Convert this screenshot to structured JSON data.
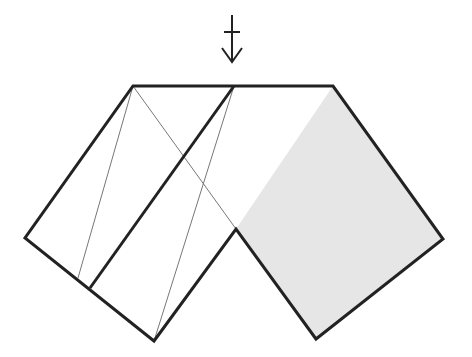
{
  "diagram": {
    "type": "origami-fold-step",
    "width": 472,
    "height": 357,
    "colors": {
      "stroke": "#222222",
      "thin_stroke": "#777777",
      "fill_shaded": "#e6e6e6",
      "background": "#ffffff"
    },
    "arrow": {
      "name": "push-down-arrow",
      "x": 232,
      "y_top": 15,
      "y_bottom": 62,
      "crossbar_y": 32,
      "crossbar_half": 8,
      "head_half": 10,
      "head_len": 14
    },
    "shaded_panel": {
      "points": "333,86 443,239 316,339 236,229"
    },
    "outline": {
      "points": "133,86 333,86 443,239 316,339 236,229 154,341 25,238"
    },
    "thick_lines": [
      {
        "x1": 234,
        "y1": 86,
        "x2": 90,
        "y2": 288
      }
    ],
    "thin_lines": [
      {
        "x1": 133,
        "y1": 86,
        "x2": 78,
        "y2": 278
      },
      {
        "x1": 133,
        "y1": 86,
        "x2": 236,
        "y2": 229
      },
      {
        "x1": 234,
        "y1": 86,
        "x2": 154,
        "y2": 341
      }
    ]
  }
}
